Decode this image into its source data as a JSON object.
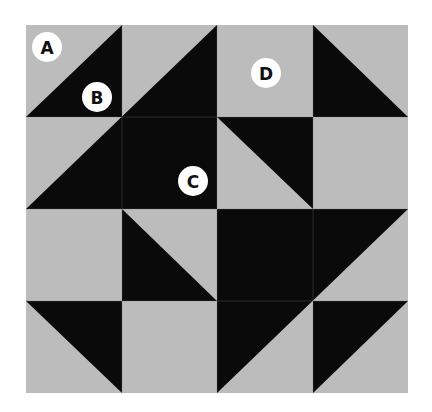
{
  "colors": {
    "light": "#bcbcbc",
    "dark": "#0a0a0a",
    "label_bg": "#ffffff",
    "label_text": "#111111"
  },
  "grid": {
    "x": [
      26,
      122,
      217,
      313,
      408
    ],
    "y": [
      25,
      117,
      209,
      301,
      393
    ]
  },
  "labels": [
    {
      "id": "A",
      "text": "A",
      "cx": 47,
      "cy": 47
    },
    {
      "id": "B",
      "text": "B",
      "cx": 97,
      "cy": 97
    },
    {
      "id": "C",
      "text": "C",
      "cx": 193,
      "cy": 181
    },
    {
      "id": "D",
      "text": "D",
      "cx": 266,
      "cy": 73
    }
  ]
}
